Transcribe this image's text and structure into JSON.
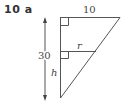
{
  "question": {
    "number": "10",
    "part": "a",
    "label": "10  a"
  },
  "diagram": {
    "type": "similar-triangles",
    "labels": {
      "top_width": "10",
      "height_total": "30",
      "mid_width": "r",
      "lower_height": "h"
    },
    "right_angle_markers": 2,
    "colors": {
      "line": "#555555",
      "text": "#444444"
    }
  }
}
